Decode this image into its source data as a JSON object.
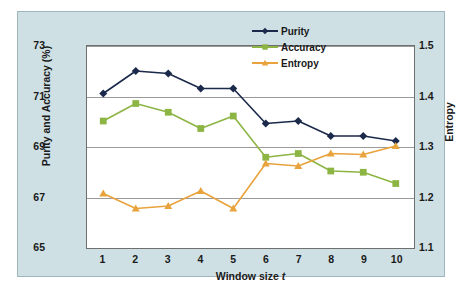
{
  "chart_data": {
    "type": "line",
    "title": "",
    "xlabel": "Window size t",
    "ylabel": "Purity and Accuracy (%)",
    "ylabel_secondary": "Entropy",
    "x": [
      1,
      2,
      3,
      4,
      5,
      6,
      7,
      8,
      9,
      10
    ],
    "xtick_labels": [
      "1",
      "2",
      "3",
      "4",
      "5",
      "6",
      "7",
      "8",
      "9",
      "10"
    ],
    "xlim": [
      0.5,
      10.5
    ],
    "ylim": [
      65,
      73
    ],
    "ytick_labels": [
      "65",
      "67",
      "69",
      "71",
      "73"
    ],
    "yticks": [
      65,
      67,
      69,
      71,
      73
    ],
    "ylim_secondary": [
      1.1,
      1.5
    ],
    "ytick_labels_secondary": [
      "1.1",
      "1.2",
      "1.3",
      "1.4",
      "1.5"
    ],
    "yticks_secondary": [
      1.1,
      1.2,
      1.3,
      1.4,
      1.5
    ],
    "grid": "horizontal",
    "legend_position": "top-right",
    "series": [
      {
        "name": "Purity",
        "axis": "left",
        "color": "#1b2a4a",
        "marker": "diamond",
        "values": [
          71.1,
          72.0,
          71.9,
          71.3,
          71.3,
          69.9,
          70.0,
          69.4,
          69.4,
          69.2
        ]
      },
      {
        "name": "Accuracy",
        "axis": "left",
        "color": "#8cb544",
        "marker": "square",
        "values": [
          70.0,
          70.7,
          70.35,
          69.7,
          70.2,
          68.55,
          68.7,
          68.0,
          67.95,
          67.5
        ]
      },
      {
        "name": "Entropy",
        "axis": "right",
        "color": "#e8a33d",
        "marker": "triangle",
        "values": [
          1.205,
          1.175,
          1.18,
          1.21,
          1.175,
          1.265,
          1.26,
          1.285,
          1.283,
          1.3
        ]
      }
    ]
  },
  "legend": {
    "items": [
      {
        "label": "Purity"
      },
      {
        "label": "Accuracy"
      },
      {
        "label": "Entropy"
      }
    ]
  },
  "axes": {
    "x_title_prefix": "Window size ",
    "x_title_variable": "t"
  },
  "colors": {
    "purity": "#1b2a4a",
    "accuracy": "#8cb544",
    "entropy": "#e8a33d",
    "panel_background": "#cfe0e4",
    "plot_background": "#ffffff",
    "gridline": "#9a9a9a",
    "frame": "#6f6f6f",
    "text": "#1a1a1a"
  }
}
